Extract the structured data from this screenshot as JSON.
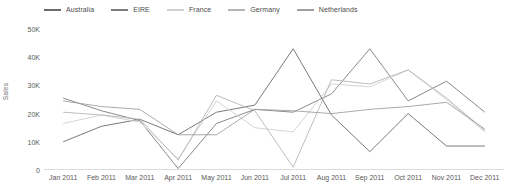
{
  "chart_data": {
    "type": "line",
    "title": "",
    "subtitle": "",
    "xlabel": "",
    "ylabel": "Sales",
    "ylim": [
      0,
      50000
    ],
    "yticks": [
      0,
      10000,
      20000,
      30000,
      40000,
      50000
    ],
    "ytick_labels": [
      "0",
      "10K",
      "20K",
      "30K",
      "40K",
      "50K"
    ],
    "grid": false,
    "legend_position": "top-left",
    "categories": [
      "Jan 2011",
      "Feb 2011",
      "Mar 2011",
      "Apr 2011",
      "May 2011",
      "Jun 2011",
      "Jul 2011",
      "Aug 2011",
      "Sep 2011",
      "Oct 2011",
      "Nov 2011",
      "Dec 2011"
    ],
    "series": [
      {
        "name": "Australia",
        "color": "#6b6b6b",
        "values": [
          10000,
          15500,
          18000,
          12500,
          20500,
          23000,
          43000,
          19500,
          6500,
          20000,
          8500,
          8500
        ]
      },
      {
        "name": "EIRE",
        "color": "#7d7d7d",
        "values": [
          25500,
          21000,
          17500,
          500,
          16500,
          21500,
          20500,
          27000,
          43000,
          24500,
          31500,
          20500
        ]
      },
      {
        "name": "France",
        "color": "#cfcfcf",
        "values": [
          16500,
          19500,
          17000,
          4000,
          24500,
          15000,
          13500,
          30500,
          29500,
          35500,
          25000,
          13500
        ]
      },
      {
        "name": "Germany",
        "color": "#b5b5b5",
        "values": [
          20500,
          19500,
          18000,
          3500,
          26500,
          21000,
          1000,
          32000,
          30500,
          35500,
          25500,
          14000
        ]
      },
      {
        "name": "Netherlands",
        "color": "#a0a0a0",
        "values": [
          24500,
          22500,
          21500,
          12500,
          12500,
          21500,
          21000,
          20000,
          21500,
          22500,
          24000,
          14500
        ]
      }
    ],
    "axis_color": "#b0b0b0"
  },
  "legend": {
    "items": [
      {
        "label": "Australia"
      },
      {
        "label": "EIRE"
      },
      {
        "label": "France"
      },
      {
        "label": "Germany"
      },
      {
        "label": "Netherlands"
      }
    ]
  }
}
